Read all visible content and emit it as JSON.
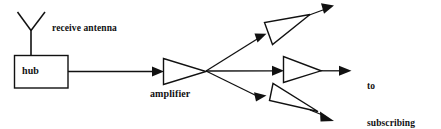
{
  "diagram": {
    "background_color": "#ffffff",
    "line_color": "#111111",
    "labels": {
      "receive_antenna": "receive antenna",
      "hub": "hub",
      "amplifier": "amplifier",
      "destination_line1": "to",
      "destination_line2": "subscribing",
      "destination_line3": "households"
    },
    "nodes": [
      {
        "name": "receive-antenna",
        "type": "antenna",
        "x": 31,
        "y": 12
      },
      {
        "name": "hub",
        "type": "box",
        "x": 14,
        "y": 55,
        "width": 54,
        "height": 33
      },
      {
        "name": "amplifier-main",
        "type": "triangle",
        "x": 163,
        "y": 59
      },
      {
        "name": "splitter-node",
        "type": "junction",
        "x": 206,
        "y": 71
      },
      {
        "name": "amplifier-upper",
        "type": "triangle",
        "x": 265,
        "y": 22
      },
      {
        "name": "amplifier-middle",
        "type": "triangle",
        "x": 283,
        "y": 57
      },
      {
        "name": "amplifier-lower",
        "type": "triangle",
        "x": 270,
        "y": 84
      }
    ],
    "edges": [
      {
        "name": "antenna-to-hub",
        "from": "receive-antenna",
        "to": "hub"
      },
      {
        "name": "hub-to-amplifier",
        "from": "hub",
        "to": "amplifier-main"
      },
      {
        "name": "splitter-to-upper",
        "from": "splitter-node",
        "to": "amplifier-upper"
      },
      {
        "name": "splitter-to-middle",
        "from": "splitter-node",
        "to": "amplifier-middle"
      },
      {
        "name": "splitter-to-lower",
        "from": "splitter-node",
        "to": "amplifier-lower"
      },
      {
        "name": "upper-output",
        "from": "amplifier-upper",
        "to": "households"
      },
      {
        "name": "middle-output",
        "from": "amplifier-middle",
        "to": "households"
      },
      {
        "name": "lower-output",
        "from": "amplifier-lower",
        "to": "households"
      }
    ]
  }
}
